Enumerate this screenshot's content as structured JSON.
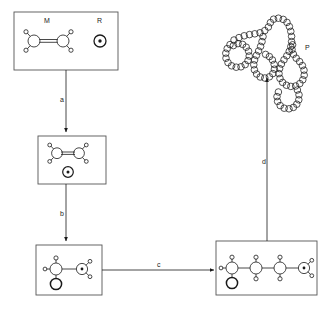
{
  "figure": {
    "type": "diagram",
    "width": 334,
    "height": 316,
    "background": "#ffffff",
    "stroke_color": "#1a1a1a",
    "box_border_color": "#555555"
  },
  "labels": {
    "monomer": "M",
    "radical": "R",
    "polymer": "P",
    "step_a": "a",
    "step_b": "b",
    "step_c": "c",
    "step_d": "d"
  },
  "boxes": [
    {
      "id": "box-reactants",
      "x": 14,
      "y": 12,
      "w": 104,
      "h": 58,
      "contents": [
        "monomer-M",
        "radical-R"
      ]
    },
    {
      "id": "box-encounter",
      "x": 38,
      "y": 136,
      "w": 68,
      "h": 48,
      "contents": [
        "monomer",
        "radical-dot"
      ]
    },
    {
      "id": "box-initiated",
      "x": 36,
      "y": 245,
      "w": 66,
      "h": 50,
      "contents": [
        "initiated-radical-adduct"
      ]
    },
    {
      "id": "box-growing-chain",
      "x": 216,
      "y": 241,
      "w": 101,
      "h": 54,
      "contents": [
        "growing-polymer-radical"
      ]
    }
  ],
  "arrows": [
    {
      "id": "arrow-a",
      "label": "a",
      "from": "box-reactants",
      "to": "box-encounter",
      "direction": "down"
    },
    {
      "id": "arrow-b",
      "label": "b",
      "from": "box-encounter",
      "to": "box-initiated",
      "direction": "down"
    },
    {
      "id": "arrow-c",
      "label": "c",
      "from": "box-initiated",
      "to": "box-growing-chain",
      "direction": "right"
    },
    {
      "id": "arrow-d",
      "label": "d",
      "from": "box-growing-chain",
      "to": "polymer-coil",
      "direction": "up"
    }
  ],
  "structures": {
    "monomer_M": {
      "description": "two carbon atoms joined by a double bond, each bearing two hydrogen atoms",
      "carbons": 2,
      "bond": "double",
      "hydrogens_per_carbon": 2
    },
    "radical_R": {
      "description": "circle containing a central dot representing an unpaired electron",
      "symbol": "circle-with-dot"
    },
    "initiated_adduct": {
      "description": "R group bonded to first carbon; second carbon carries the radical dot",
      "carbons": 2,
      "bond": "single"
    },
    "growing_chain": {
      "description": "four-carbon chain terminated by a radical carbon, R group on first carbon",
      "carbons": 4,
      "terminal": "radical"
    },
    "polymer_coil": {
      "description": "long random-coil chain of linked beads representing the polymer product",
      "beads": 84
    }
  }
}
